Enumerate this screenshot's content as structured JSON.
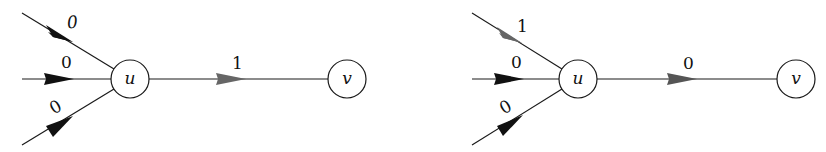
{
  "diagrams": [
    {
      "name": "left",
      "nodes": {
        "u": "u",
        "v": "v"
      },
      "incoming_labels": [
        "0",
        "0",
        "0"
      ],
      "incoming_arrow_colors": [
        "#111111",
        "#111111",
        "#111111"
      ],
      "out_label": "1",
      "out_arrow_color": "#666666"
    },
    {
      "name": "right",
      "nodes": {
        "u": "u",
        "v": "v"
      },
      "incoming_labels": [
        "1",
        "0",
        "0"
      ],
      "incoming_arrow_colors": [
        "#666666",
        "#111111",
        "#111111"
      ],
      "out_label": "0",
      "out_arrow_color": "#555555"
    }
  ]
}
